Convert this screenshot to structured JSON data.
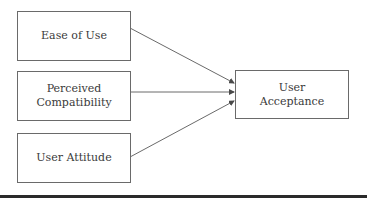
{
  "diagram": {
    "type": "flow",
    "nodes": [
      {
        "id": "ease",
        "label": "Ease of Use"
      },
      {
        "id": "compat",
        "label_line1": "Perceived",
        "label_line2": "Compatibility"
      },
      {
        "id": "attitude",
        "label": "User Attitude"
      },
      {
        "id": "acceptance",
        "label_line1": "User",
        "label_line2": "Acceptance"
      }
    ],
    "edges": [
      {
        "from": "ease",
        "to": "acceptance"
      },
      {
        "from": "compat",
        "to": "acceptance"
      },
      {
        "from": "attitude",
        "to": "acceptance"
      }
    ],
    "colors": {
      "stroke": "#6a6a6a",
      "text": "#3a3a3a",
      "rule": "#2a2a2a"
    }
  }
}
